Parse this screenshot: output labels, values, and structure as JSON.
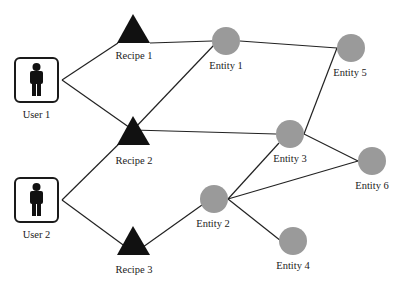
{
  "diagram": {
    "type": "graph",
    "colors": {
      "edge": "#222222",
      "user_box": "#1a1a1a",
      "recipe": "#111111",
      "entity": "#9a9a9a",
      "background": "#ffffff"
    },
    "users": [
      {
        "id": "user1",
        "label": "User 1",
        "icon": "person-icon"
      },
      {
        "id": "user2",
        "label": "User 2",
        "icon": "person-icon"
      }
    ],
    "recipes": [
      {
        "id": "recipe1",
        "label": "Recipe 1",
        "shape": "triangle"
      },
      {
        "id": "recipe2",
        "label": "Recipe 2",
        "shape": "triangle"
      },
      {
        "id": "recipe3",
        "label": "Recipe 3",
        "shape": "triangle"
      }
    ],
    "entities": [
      {
        "id": "entity1",
        "label": "Entity 1",
        "shape": "circle"
      },
      {
        "id": "entity2",
        "label": "Entity 2",
        "shape": "circle"
      },
      {
        "id": "entity3",
        "label": "Entity 3",
        "shape": "circle"
      },
      {
        "id": "entity4",
        "label": "Entity 4",
        "shape": "circle"
      },
      {
        "id": "entity5",
        "label": "Entity 5",
        "shape": "circle"
      },
      {
        "id": "entity6",
        "label": "Entity 6",
        "shape": "circle"
      }
    ],
    "edges": [
      [
        "user1",
        "recipe1"
      ],
      [
        "user1",
        "recipe2"
      ],
      [
        "user2",
        "recipe2"
      ],
      [
        "user2",
        "recipe3"
      ],
      [
        "recipe1",
        "entity1"
      ],
      [
        "recipe2",
        "entity1"
      ],
      [
        "recipe2",
        "entity3"
      ],
      [
        "recipe3",
        "entity2"
      ],
      [
        "entity1",
        "entity5"
      ],
      [
        "entity5",
        "entity3"
      ],
      [
        "entity3",
        "entity6"
      ],
      [
        "entity2",
        "entity3"
      ],
      [
        "entity2",
        "entity6"
      ],
      [
        "entity2",
        "entity4"
      ]
    ]
  }
}
